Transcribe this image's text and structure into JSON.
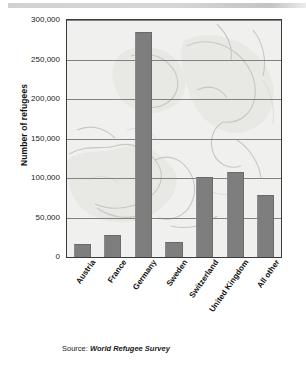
{
  "figure": {
    "source_label": "Source:",
    "source_title": "World Refugee Survey"
  },
  "chart_data": {
    "type": "bar",
    "title": "",
    "subtitle": "",
    "xlabel": "",
    "ylabel": "Number of refugees",
    "categories": [
      "Austria",
      "France",
      "Germany",
      "Sweden",
      "Switzerland",
      "United Kingdom",
      "All other"
    ],
    "values": [
      16000,
      28000,
      285000,
      19000,
      101000,
      108000,
      79000
    ],
    "ylim": [
      0,
      300000
    ],
    "ytick_values": [
      0,
      50000,
      100000,
      150000,
      200000,
      250000,
      300000
    ],
    "ytick_labels": [
      "0",
      "50,000",
      "100,000",
      "150,000",
      "200,000",
      "250,000",
      "300,000"
    ],
    "grid": true,
    "legend": "none",
    "bar_color": "#7e7e7e",
    "plot_background": "#f0f0ee",
    "background_image": "europe-map-watermark",
    "annotations": [
      "Source: World Refugee Survey"
    ]
  }
}
